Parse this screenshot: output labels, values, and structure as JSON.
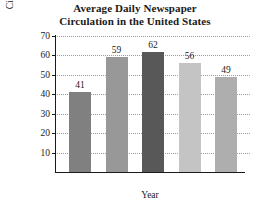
{
  "chart_data": {
    "type": "bar",
    "title": "Average Daily Newspaper Circulation in the United States",
    "title_lines": [
      "Average Daily Newspaper",
      "Circulation in the United States"
    ],
    "categories": [
      "1940",
      "1960",
      "1980",
      "2000",
      "2008"
    ],
    "values": [
      41,
      59,
      62,
      56,
      49
    ],
    "bar_colors": [
      "#808080",
      "#989898",
      "#585858",
      "#c4c4c4",
      "#aeaeae"
    ],
    "xlabel": "Year",
    "ylabel": "Average Daily Circulation (millions)",
    "ylabel_lines": [
      "Average Daily",
      "Circulation (millions)"
    ],
    "ylim": [
      0,
      70
    ],
    "yticks": [
      10,
      20,
      30,
      40,
      50,
      60,
      70
    ],
    "ytick_labels": [
      "10",
      "20",
      "30",
      "40",
      "50",
      "60",
      "70"
    ],
    "grid": true,
    "grid_style": "dotted",
    "legend": "none",
    "value_labels": [
      "41",
      "59",
      "62",
      "56",
      "49"
    ]
  }
}
